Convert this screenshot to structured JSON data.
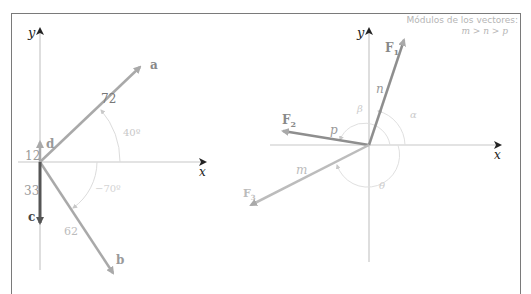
{
  "colors": {
    "frame": "#7a7a7a",
    "axis": "#c8c8c8",
    "axis_arrow": "#222222",
    "vector": "#a9a9a9",
    "vector_dark": "#555555",
    "label_light": "#a0a0a0",
    "angle_light": "#d0d0d0"
  },
  "left_diagram": {
    "axis_y_label": "y",
    "axis_x_label": "x",
    "vectors": [
      {
        "name": "a",
        "magnitude": "72",
        "angle_label": "40º"
      },
      {
        "name": "b",
        "magnitude": "62",
        "angle_label": "−70º"
      },
      {
        "name": "c",
        "magnitude": "33"
      },
      {
        "name": "d",
        "magnitude": "12"
      }
    ]
  },
  "right_diagram": {
    "axis_y_label": "y",
    "axis_x_label": "x",
    "note_title": "Módulos de los vectores:",
    "note_relation": "m > n > p",
    "vectors": [
      {
        "name": "F",
        "sub": "1",
        "magnitude_label": "n",
        "angle_label": "α"
      },
      {
        "name": "F",
        "sub": "2",
        "magnitude_label": "p",
        "angle_label": "β"
      },
      {
        "name": "F",
        "sub": "3",
        "magnitude_label": "m",
        "angle_label": "θ"
      }
    ]
  }
}
